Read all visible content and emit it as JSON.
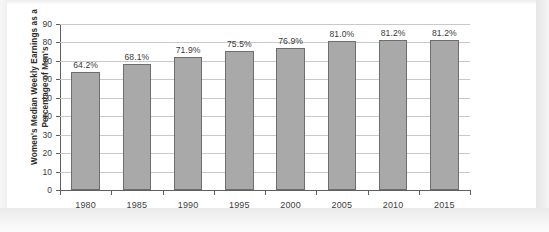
{
  "chart_data": {
    "type": "bar",
    "title": "",
    "xlabel": "",
    "ylabel": "Women's Median Weekly Earnings as a Percentage of Men's",
    "ylabel_lines": [
      "Women's Median Weekly Earnings as a",
      "Percentage of Men's"
    ],
    "categories": [
      "1980",
      "1985",
      "1990",
      "1995",
      "2000",
      "2005",
      "2010",
      "2015"
    ],
    "values": [
      64.2,
      68.1,
      71.9,
      75.5,
      76.9,
      81.0,
      81.2,
      81.2
    ],
    "data_labels": [
      "64.2%",
      "68.1%",
      "71.9%",
      "75.5%",
      "76.9%",
      "81.0%",
      "81.2%",
      "81.2%"
    ],
    "ylim": [
      0,
      90
    ],
    "ytick_values": [
      0,
      10,
      20,
      30,
      40,
      50,
      60,
      70,
      80,
      90
    ],
    "ytick_labels": [
      "0",
      "10",
      "20",
      "30",
      "40",
      "50",
      "60",
      "70",
      "80",
      "90"
    ],
    "grid": true,
    "grid_axis": "y",
    "legend": false,
    "legend_position": "none",
    "bar_color": "#a9a9a9",
    "bar_edge_color": "#6e6e6e",
    "gridline_color": "#c9c9c9",
    "axis_color": "#5f5f5f",
    "background_color": "#ffffff"
  }
}
